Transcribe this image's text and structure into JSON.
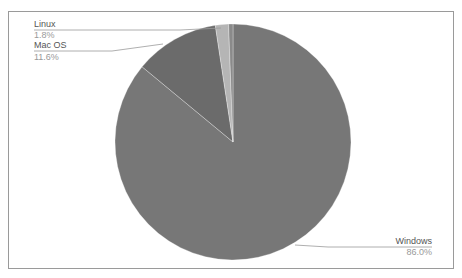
{
  "chart_data": {
    "type": "pie",
    "title": "",
    "slices": [
      {
        "label": "Windows",
        "value": 86.0,
        "display": "86.0%",
        "color": "#777777"
      },
      {
        "label": "Mac OS",
        "value": 11.6,
        "display": "11.6%",
        "color": "#6b6b6b"
      },
      {
        "label": "Linux",
        "value": 1.8,
        "display": "1.8%",
        "color": "#b5b5b5"
      },
      {
        "label": "Other",
        "value": 0.6,
        "display": "",
        "color": "#8a8a8a"
      }
    ],
    "start_angle": "12 o'clock",
    "direction": "clockwise",
    "legend": "none (callout labels)"
  },
  "labels": {
    "linux_name": "Linux",
    "linux_pct": "1.8%",
    "mac_name": "Mac OS",
    "mac_pct": "11.6%",
    "windows_name": "Windows",
    "windows_pct": "86.0%"
  }
}
